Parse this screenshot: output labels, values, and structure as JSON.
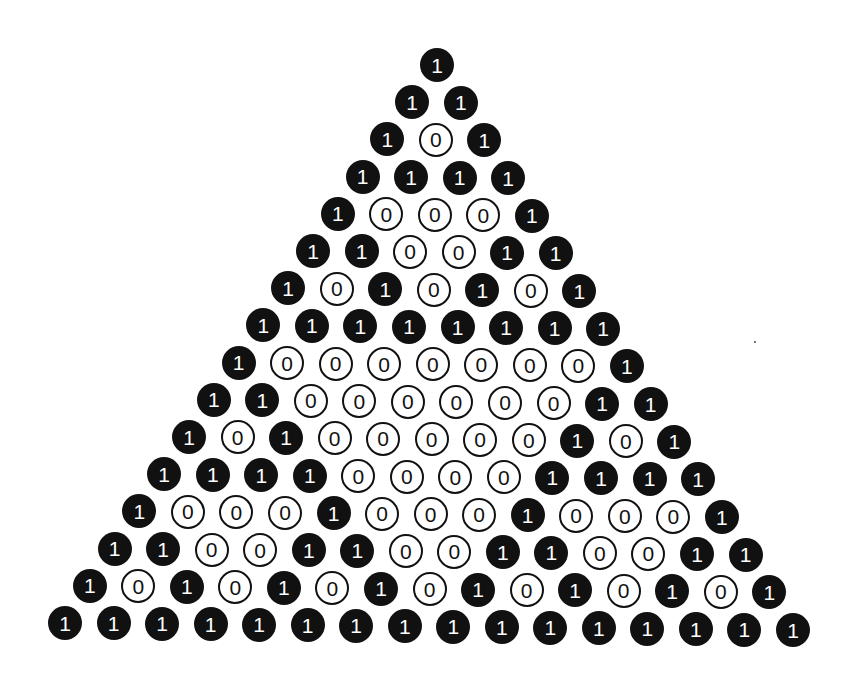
{
  "colors": {
    "one_fill": "#111111",
    "one_text": "#ffffff",
    "zero_fill": "#ffffff",
    "zero_stroke": "#111111"
  },
  "layout": {
    "apex": [
      437,
      65
    ],
    "bottom_left": [
      65,
      623
    ],
    "bottom_right": [
      793,
      630
    ],
    "circle_diameter": 34
  },
  "speck": [
    754,
    341
  ],
  "rows": [
    [
      1
    ],
    [
      1,
      1
    ],
    [
      1,
      0,
      1
    ],
    [
      1,
      1,
      1,
      1
    ],
    [
      1,
      0,
      0,
      0,
      1
    ],
    [
      1,
      1,
      0,
      0,
      1,
      1
    ],
    [
      1,
      0,
      1,
      0,
      1,
      0,
      1
    ],
    [
      1,
      1,
      1,
      1,
      1,
      1,
      1,
      1
    ],
    [
      1,
      0,
      0,
      0,
      0,
      0,
      0,
      0,
      1
    ],
    [
      1,
      1,
      0,
      0,
      0,
      0,
      0,
      0,
      1,
      1
    ],
    [
      1,
      0,
      1,
      0,
      0,
      0,
      0,
      0,
      1,
      0,
      1
    ],
    [
      1,
      1,
      1,
      1,
      0,
      0,
      0,
      0,
      1,
      1,
      1,
      1
    ],
    [
      1,
      0,
      0,
      0,
      1,
      0,
      0,
      0,
      1,
      0,
      0,
      0,
      1
    ],
    [
      1,
      1,
      0,
      0,
      1,
      1,
      0,
      0,
      1,
      1,
      0,
      0,
      1,
      1
    ],
    [
      1,
      0,
      1,
      0,
      1,
      0,
      1,
      0,
      1,
      0,
      1,
      0,
      1,
      0,
      1
    ],
    [
      1,
      1,
      1,
      1,
      1,
      1,
      1,
      1,
      1,
      1,
      1,
      1,
      1,
      1,
      1,
      1
    ]
  ]
}
